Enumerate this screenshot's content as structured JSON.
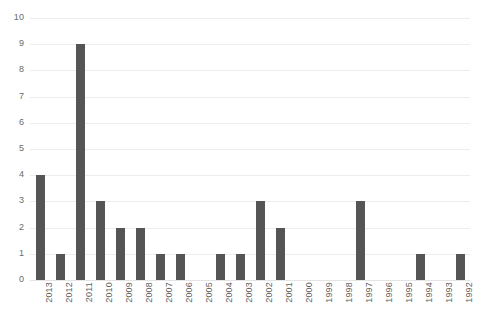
{
  "chart_data": {
    "type": "bar",
    "title": "",
    "subtitle": "",
    "xlabel": "",
    "ylabel": "",
    "categories": [
      "2013",
      "2012",
      "2011",
      "2010",
      "2009",
      "2008",
      "2007",
      "2006",
      "2005",
      "2004",
      "2003",
      "2002",
      "2001",
      "2000",
      "1999",
      "1998",
      "1997",
      "1996",
      "1995",
      "1994",
      "1993",
      "1992"
    ],
    "values": [
      4,
      1,
      9,
      3,
      2,
      2,
      1,
      1,
      0,
      1,
      1,
      3,
      2,
      0,
      0,
      0,
      3,
      0,
      0,
      1,
      0,
      1
    ],
    "yticks": [
      "0",
      "1",
      "2",
      "3",
      "4",
      "5",
      "6",
      "7",
      "8",
      "9",
      "10"
    ],
    "ylim": [
      0,
      10
    ],
    "ytick_step": 1,
    "grid": "horizontal",
    "legend": "none",
    "annotations": [],
    "colors": {
      "bar": "#555555",
      "gridline": "#ededed",
      "background": "#ffffff",
      "tick_label": "#6a6a6a"
    }
  }
}
